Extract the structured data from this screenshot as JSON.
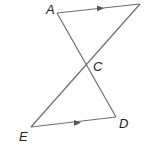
{
  "diagram": {
    "type": "geometry",
    "points": {
      "A": {
        "label": "A",
        "x": 57,
        "y": 13,
        "lx": 46,
        "ly": 14
      },
      "B": {
        "label": "",
        "x": 140,
        "y": 4
      },
      "C": {
        "label": "C",
        "x": 86,
        "y": 66,
        "lx": 93,
        "ly": 71
      },
      "D": {
        "label": "D",
        "x": 116,
        "y": 117,
        "lx": 119,
        "ly": 128
      },
      "E": {
        "label": "E",
        "x": 31,
        "y": 127,
        "lx": 19,
        "ly": 141
      }
    },
    "segments": [
      {
        "from": "A",
        "to": "B",
        "parallel_arrow": true
      },
      {
        "from": "A",
        "to": "D",
        "parallel_arrow": false
      },
      {
        "from": "B",
        "to": "E",
        "parallel_arrow": false
      },
      {
        "from": "E",
        "to": "D",
        "parallel_arrow": true
      }
    ],
    "stroke_color": "#6e6e6e"
  }
}
